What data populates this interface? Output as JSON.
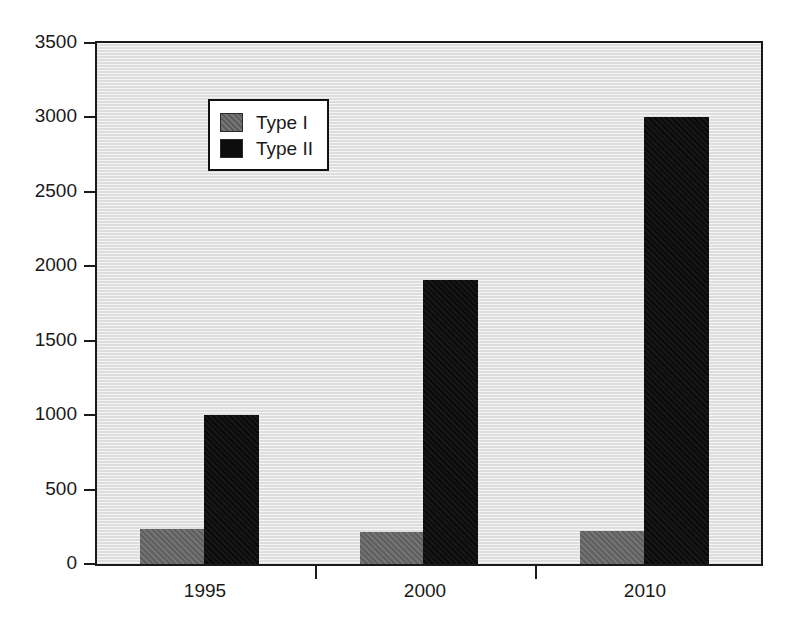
{
  "chart_data": {
    "type": "bar",
    "title": "",
    "subtitle": "",
    "xlabel": "",
    "ylabel": "",
    "categories": [
      "1995",
      "2000",
      "2010"
    ],
    "series": [
      {
        "name": "Type I",
        "values": [
          235,
          215,
          220
        ],
        "color": "#6a6a6a"
      },
      {
        "name": "Type II",
        "values": [
          1000,
          1910,
          3000
        ],
        "color": "#0d0d0d"
      }
    ],
    "ylim": [
      0,
      3500
    ],
    "yticks": [
      0,
      500,
      1000,
      1500,
      2000,
      2500,
      3000,
      3500
    ],
    "ytick_labels": [
      "0",
      "500",
      "1000",
      "1500",
      "2000",
      "2500",
      "3000",
      "3500"
    ],
    "xtick_labels": [
      "1995",
      "2000",
      "2010"
    ],
    "grid": false,
    "legend_position": "upper left",
    "legend_entries": [
      "Type I",
      "Type II"
    ],
    "plot_background_color": "#e9e9e9",
    "axis_color": "#1a1a1a"
  }
}
